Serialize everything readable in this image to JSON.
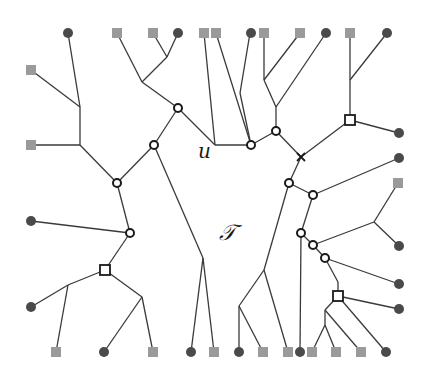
{
  "diagram": {
    "labels": {
      "u": "u",
      "tree": "𝒯"
    },
    "colors": {
      "edge": "#3a3a3a",
      "leaf_circle": "#4a4a4a",
      "leaf_square": "#9a9a9a",
      "inner_stroke": "#1a1a1a"
    },
    "leaf_circles": [
      [
        68,
        33
      ],
      [
        178,
        33
      ],
      [
        251,
        33
      ],
      [
        326,
        33
      ],
      [
        387,
        33
      ],
      [
        399,
        133
      ],
      [
        399,
        158
      ],
      [
        399,
        246
      ],
      [
        399,
        284
      ],
      [
        399,
        309
      ],
      [
        31,
        221
      ],
      [
        31,
        307
      ],
      [
        104,
        352
      ],
      [
        191,
        352
      ],
      [
        239,
        352
      ],
      [
        300,
        352
      ],
      [
        386,
        352
      ]
    ],
    "leaf_squares": [
      [
        117,
        33
      ],
      [
        153,
        33
      ],
      [
        204,
        33
      ],
      [
        216,
        33
      ],
      [
        264,
        33
      ],
      [
        300,
        33
      ],
      [
        350,
        33
      ],
      [
        398,
        183
      ],
      [
        31,
        70
      ],
      [
        31,
        145
      ],
      [
        56,
        352
      ],
      [
        153,
        352
      ],
      [
        214,
        352
      ],
      [
        263,
        352
      ],
      [
        288,
        352
      ],
      [
        312,
        352
      ],
      [
        336,
        352
      ],
      [
        361,
        352
      ]
    ],
    "inner_circles": [
      [
        178,
        108
      ],
      [
        154,
        145
      ],
      [
        117,
        183
      ],
      [
        130,
        233
      ],
      [
        251,
        145
      ],
      [
        276,
        131
      ],
      [
        289,
        183
      ],
      [
        313,
        195
      ],
      [
        301,
        233
      ],
      [
        313,
        245
      ],
      [
        325,
        258
      ]
    ],
    "inner_squares": [
      [
        350,
        120
      ],
      [
        105,
        270
      ],
      [
        338,
        296
      ]
    ],
    "crosses": [
      [
        301,
        157
      ]
    ],
    "edges": [
      [
        68,
        33,
        80,
        107
      ],
      [
        31,
        70,
        80,
        107
      ],
      [
        80,
        107,
        80,
        145
      ],
      [
        31,
        145,
        80,
        145
      ],
      [
        80,
        145,
        117,
        183
      ],
      [
        117,
        183,
        154,
        145
      ],
      [
        154,
        145,
        178,
        108
      ],
      [
        178,
        108,
        142,
        82
      ],
      [
        142,
        82,
        117,
        33
      ],
      [
        142,
        82,
        167,
        57
      ],
      [
        167,
        57,
        153,
        33
      ],
      [
        167,
        57,
        178,
        33
      ],
      [
        178,
        108,
        215,
        145
      ],
      [
        215,
        145,
        204,
        33
      ],
      [
        215,
        145,
        251,
        145
      ],
      [
        251,
        145,
        216,
        33
      ],
      [
        251,
        145,
        240,
        93
      ],
      [
        240,
        93,
        250,
        33
      ],
      [
        251,
        145,
        276,
        131
      ],
      [
        276,
        131,
        276,
        107
      ],
      [
        276,
        107,
        264,
        80
      ],
      [
        264,
        80,
        264,
        33
      ],
      [
        264,
        80,
        300,
        33
      ],
      [
        276,
        107,
        326,
        33
      ],
      [
        276,
        131,
        301,
        157
      ],
      [
        301,
        157,
        350,
        120
      ],
      [
        350,
        120,
        350,
        80
      ],
      [
        350,
        80,
        350,
        33
      ],
      [
        350,
        80,
        387,
        33
      ],
      [
        350,
        120,
        399,
        133
      ],
      [
        301,
        157,
        289,
        183
      ],
      [
        289,
        183,
        313,
        195
      ],
      [
        313,
        195,
        399,
        158
      ],
      [
        289,
        183,
        264,
        270
      ],
      [
        264,
        270,
        239,
        306
      ],
      [
        239,
        306,
        239,
        352
      ],
      [
        239,
        306,
        263,
        352
      ],
      [
        264,
        270,
        288,
        352
      ],
      [
        313,
        195,
        301,
        233
      ],
      [
        301,
        233,
        300,
        352
      ],
      [
        301,
        233,
        313,
        245
      ],
      [
        313,
        245,
        374,
        222
      ],
      [
        374,
        222,
        398,
        183
      ],
      [
        374,
        222,
        399,
        246
      ],
      [
        313,
        245,
        325,
        258
      ],
      [
        325,
        258,
        399,
        284
      ],
      [
        325,
        258,
        338,
        282
      ],
      [
        338,
        282,
        338,
        296
      ],
      [
        338,
        296,
        399,
        309
      ],
      [
        338,
        296,
        386,
        352
      ],
      [
        338,
        296,
        325,
        310
      ],
      [
        325,
        310,
        361,
        352
      ],
      [
        325,
        310,
        325,
        325
      ],
      [
        325,
        325,
        312,
        352
      ],
      [
        325,
        325,
        336,
        352
      ],
      [
        154,
        145,
        203,
        258
      ],
      [
        203,
        258,
        191,
        352
      ],
      [
        203,
        258,
        214,
        352
      ],
      [
        117,
        183,
        130,
        233
      ],
      [
        130,
        233,
        31,
        221
      ],
      [
        130,
        233,
        105,
        270
      ],
      [
        105,
        270,
        68,
        285
      ],
      [
        68,
        285,
        31,
        307
      ],
      [
        68,
        285,
        56,
        352
      ],
      [
        105,
        270,
        142,
        297
      ],
      [
        142,
        297,
        104,
        352
      ],
      [
        142,
        297,
        153,
        352
      ]
    ]
  }
}
